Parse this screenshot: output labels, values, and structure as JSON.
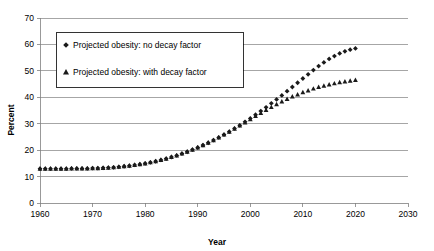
{
  "chart_data": {
    "type": "scatter",
    "title": "",
    "xlabel": "Year",
    "ylabel": "Percent",
    "xlim": [
      1960,
      2030
    ],
    "ylim": [
      0,
      70
    ],
    "xticks": [
      1960,
      1970,
      1980,
      1990,
      2000,
      2010,
      2020,
      2030
    ],
    "yticks": [
      0,
      10,
      20,
      30,
      40,
      50,
      60,
      70
    ],
    "grid": true,
    "legend_position": "upper-left",
    "series": [
      {
        "name": "Projected obesity: no decay factor",
        "marker": "diamond",
        "color": "#1a1a1a",
        "x": [
          1960,
          1961,
          1962,
          1963,
          1964,
          1965,
          1966,
          1967,
          1968,
          1969,
          1970,
          1971,
          1972,
          1973,
          1974,
          1975,
          1976,
          1977,
          1978,
          1979,
          1980,
          1981,
          1982,
          1983,
          1984,
          1985,
          1986,
          1987,
          1988,
          1989,
          1990,
          1991,
          1992,
          1993,
          1994,
          1995,
          1996,
          1997,
          1998,
          1999,
          2000,
          2001,
          2002,
          2003,
          2004,
          2005,
          2006,
          2007,
          2008,
          2009,
          2010,
          2011,
          2012,
          2013,
          2014,
          2015,
          2016,
          2017,
          2018,
          2019,
          2020
        ],
        "values": [
          13.0,
          13.0,
          13.0,
          13.0,
          13.0,
          13.0,
          13.1,
          13.1,
          13.1,
          13.1,
          13.2,
          13.2,
          13.3,
          13.4,
          13.5,
          13.7,
          13.9,
          14.1,
          14.4,
          14.7,
          15.0,
          15.4,
          15.8,
          16.3,
          16.8,
          17.4,
          18.0,
          18.7,
          19.4,
          20.2,
          21.0,
          21.9,
          22.8,
          23.8,
          24.8,
          25.9,
          27.0,
          28.2,
          29.4,
          30.7,
          32.0,
          33.4,
          34.8,
          36.2,
          37.7,
          39.2,
          40.7,
          42.3,
          43.9,
          45.5,
          47.1,
          48.7,
          50.3,
          51.8,
          53.2,
          54.5,
          55.6,
          56.6,
          57.4,
          58.0,
          58.5
        ]
      },
      {
        "name": "Projected obesity: with decay factor",
        "marker": "triangle",
        "color": "#1a1a1a",
        "x": [
          1960,
          1961,
          1962,
          1963,
          1964,
          1965,
          1966,
          1967,
          1968,
          1969,
          1970,
          1971,
          1972,
          1973,
          1974,
          1975,
          1976,
          1977,
          1978,
          1979,
          1980,
          1981,
          1982,
          1983,
          1984,
          1985,
          1986,
          1987,
          1988,
          1989,
          1990,
          1991,
          1992,
          1993,
          1994,
          1995,
          1996,
          1997,
          1998,
          1999,
          2000,
          2001,
          2002,
          2003,
          2004,
          2005,
          2006,
          2007,
          2008,
          2009,
          2010,
          2011,
          2012,
          2013,
          2014,
          2015,
          2016,
          2017,
          2018,
          2019,
          2020
        ],
        "values": [
          13.0,
          13.0,
          13.0,
          13.0,
          13.0,
          13.0,
          13.1,
          13.1,
          13.1,
          13.1,
          13.2,
          13.2,
          13.3,
          13.4,
          13.5,
          13.7,
          13.9,
          14.1,
          14.4,
          14.7,
          15.0,
          15.4,
          15.8,
          16.3,
          16.8,
          17.4,
          18.0,
          18.7,
          19.4,
          20.2,
          21.0,
          21.9,
          22.8,
          23.8,
          24.8,
          25.9,
          27.0,
          28.1,
          29.3,
          30.5,
          31.7,
          32.9,
          34.1,
          35.2,
          36.3,
          37.4,
          38.4,
          39.4,
          40.3,
          41.1,
          41.9,
          42.6,
          43.3,
          43.9,
          44.4,
          44.9,
          45.3,
          45.7,
          46.0,
          46.3,
          46.6
        ]
      }
    ]
  }
}
